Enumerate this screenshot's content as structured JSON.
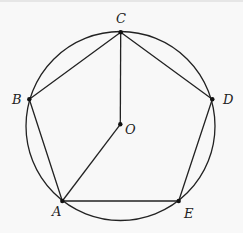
{
  "diagram": {
    "circle": {
      "cx": 120.5,
      "cy": 126,
      "r": 94.5
    },
    "stroke_color": "#222222",
    "background_color": "#f8f8f8",
    "points": {
      "A": {
        "label": "A",
        "x": 62.3,
        "y": 201
      },
      "B": {
        "label": "B",
        "x": 29.3,
        "y": 99.3
      },
      "C": {
        "label": "C",
        "x": 120.7,
        "y": 32.3
      },
      "D": {
        "label": "D",
        "x": 212.3,
        "y": 99.3
      },
      "E": {
        "label": "E",
        "x": 178.7,
        "y": 201
      },
      "O": {
        "label": "O",
        "x": 120.3,
        "y": 124.3
      }
    },
    "segments": [
      [
        "A",
        "B"
      ],
      [
        "B",
        "C"
      ],
      [
        "C",
        "D"
      ],
      [
        "D",
        "E"
      ],
      [
        "E",
        "A"
      ],
      [
        "C",
        "O"
      ],
      [
        "O",
        "A"
      ]
    ],
    "labels": {
      "A": "A",
      "B": "B",
      "C": "C",
      "D": "D",
      "E": "E",
      "O": "O"
    }
  }
}
